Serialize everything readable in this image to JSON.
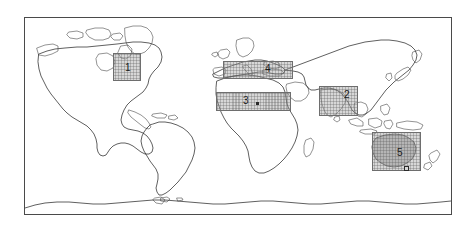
{
  "figure": {
    "type": "world-map",
    "projection": "equirectangular",
    "background_color": "#ffffff",
    "frame": {
      "border_color": "#4a4a4a",
      "x": 24,
      "y": 17,
      "width": 428,
      "height": 198
    },
    "coastline_color": "#2b2b2b"
  },
  "regions": [
    {
      "id": "region-1",
      "label": "1",
      "name": "north-america-great-lakes",
      "x": 88,
      "y": 35,
      "width": 28,
      "height": 28,
      "label_x": 100,
      "label_y": 45,
      "fill_color": "#a0a0a0",
      "border_color": "#6e6e6e"
    },
    {
      "id": "region-4",
      "label": "4",
      "name": "europe-mediterranean",
      "x": 198,
      "y": 43,
      "width": 70,
      "height": 18,
      "label_x": 240,
      "label_y": 46,
      "fill_color": "#a0a0a0",
      "border_color": "#6e6e6e"
    },
    {
      "id": "region-3",
      "label": "3",
      "name": "sahara-north-africa",
      "x": 191,
      "y": 74,
      "width": 75,
      "height": 19,
      "label_x": 218,
      "label_y": 78,
      "fill_color": "#a0a0a0",
      "border_color": "#6e6e6e"
    },
    {
      "id": "region-2",
      "label": "2",
      "name": "india-south-asia",
      "x": 294,
      "y": 68,
      "width": 39,
      "height": 30,
      "label_x": 319,
      "label_y": 72,
      "fill_color": "#a0a0a0",
      "border_color": "#6e6e6e"
    },
    {
      "id": "region-5",
      "label": "5",
      "name": "australia",
      "x": 347,
      "y": 114,
      "width": 49,
      "height": 39,
      "label_x": 372,
      "label_y": 130,
      "fill_color": "#a0a0a0",
      "border_color": "#6e6e6e"
    }
  ],
  "markers": [
    {
      "name": "marker-region-3",
      "x": 231,
      "y": 84
    },
    {
      "name": "marker-region-5",
      "x": 379,
      "y": 148
    }
  ]
}
